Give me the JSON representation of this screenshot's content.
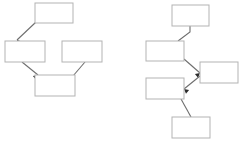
{
  "canvas": {
    "width": 242,
    "height": 142,
    "background": "#ffffff",
    "box_fill": "#ffffff",
    "box_stroke": "#b3b3b3",
    "edge_stroke": "#6e6e6e",
    "arrowhead_fill": "#2b2b2b"
  },
  "diagrams": [
    {
      "id": "left-diagram",
      "name": "left-flowchart",
      "nodes": [
        {
          "id": "l1",
          "name": "left-node-top",
          "label": "",
          "x": 35,
          "y": 3,
          "w": 38,
          "h": 20
        },
        {
          "id": "l2",
          "name": "left-node-middle-left",
          "label": "",
          "x": 5,
          "y": 41,
          "w": 40,
          "h": 21
        },
        {
          "id": "l3",
          "name": "left-node-middle-right",
          "label": "",
          "x": 62,
          "y": 41,
          "w": 40,
          "h": 21
        },
        {
          "id": "l4",
          "name": "left-node-bottom",
          "label": "",
          "x": 35,
          "y": 75,
          "w": 40,
          "h": 21
        }
      ],
      "edges": [
        {
          "id": "le1",
          "name": "left-edge-top-to-middle-left",
          "from": "l1",
          "to": "l2",
          "points": "36,22 17,40",
          "head_at": "17,40",
          "head_angle": 225
        },
        {
          "id": "le2",
          "name": "left-edge-middle-left-to-bottom",
          "from": "l2",
          "to": "l4",
          "points": "22,62 38,75",
          "head_at": "38,75",
          "head_angle": 320
        },
        {
          "id": "le3",
          "name": "left-edge-bottom-to-middle-right",
          "from": "l4",
          "to": "l3",
          "points": "73,76 85,62",
          "head_at": "85,62",
          "head_angle": 50
        }
      ]
    },
    {
      "id": "right-diagram",
      "name": "right-flowchart",
      "nodes": [
        {
          "id": "r1",
          "name": "right-node-top",
          "label": "",
          "x": 172,
          "y": 5,
          "w": 37,
          "h": 21
        },
        {
          "id": "r2",
          "name": "right-node-second",
          "label": "",
          "x": 146,
          "y": 41,
          "w": 38,
          "h": 20
        },
        {
          "id": "r3",
          "name": "right-node-side",
          "label": "",
          "x": 200,
          "y": 62,
          "w": 38,
          "h": 21
        },
        {
          "id": "r4",
          "name": "right-node-fourth",
          "label": "",
          "x": 146,
          "y": 78,
          "w": 38,
          "h": 21
        },
        {
          "id": "r5",
          "name": "right-node-bottom",
          "label": "",
          "x": 172,
          "y": 117,
          "w": 38,
          "h": 21
        }
      ],
      "edges": [
        {
          "id": "re1",
          "name": "right-edge-top-to-second",
          "from": "r1",
          "to": "r2",
          "points": "190,26 190,32 178,41",
          "head_at": "178,41",
          "head_angle": 215
        },
        {
          "id": "re2",
          "name": "right-edge-second-to-side",
          "from": "r2",
          "to": "r3",
          "points": "184,59 200,73",
          "head_at": "200,73",
          "head_angle": 320
        },
        {
          "id": "re3",
          "name": "right-edge-side-to-fourth",
          "from": "r3",
          "to": "r4",
          "points": "200,76 184,89",
          "head_at": "184,89",
          "head_angle": 220
        },
        {
          "id": "re4",
          "name": "right-edge-fourth-to-bottom",
          "from": "r4",
          "to": "r5",
          "points": "181,99 191,117",
          "head_at": "191,117",
          "head_angle": 300
        }
      ]
    }
  ]
}
